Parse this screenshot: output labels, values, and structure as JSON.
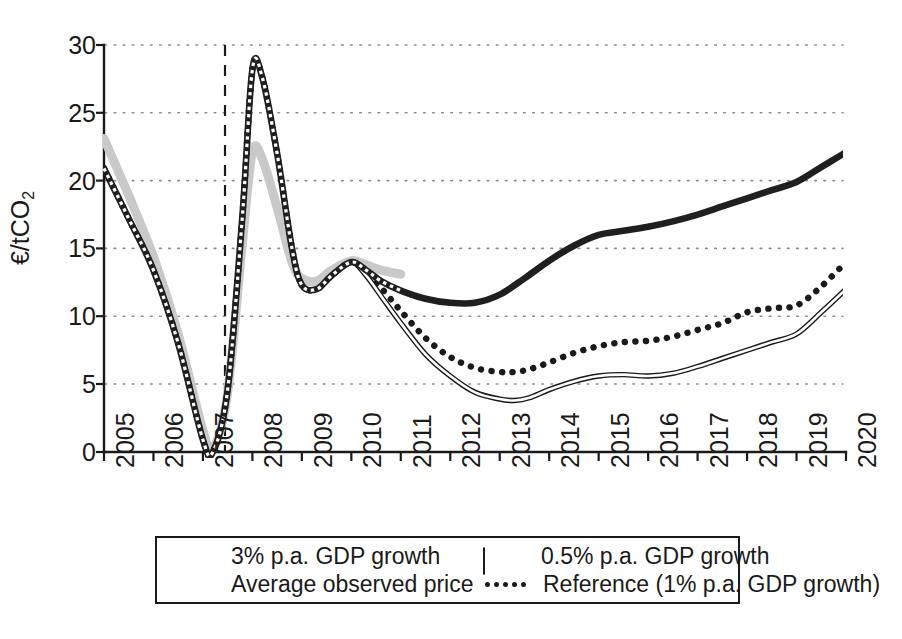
{
  "chart_data": {
    "type": "line",
    "title": "",
    "xlabel": "",
    "ylabel": "€/tCO2",
    "ylabel_base": "€/tCO",
    "ylabel_sub": "2",
    "xlim": [
      2005,
      2020
    ],
    "ylim": [
      0,
      30
    ],
    "yticks": [
      0,
      5,
      10,
      15,
      20,
      25,
      30
    ],
    "xticks": [
      "2005",
      "2006",
      "2007",
      "2008",
      "2009",
      "2010",
      "2011",
      "2012",
      "2013",
      "2014",
      "2015",
      "2016",
      "2017",
      "2018",
      "2019",
      "2020"
    ],
    "grid": "horizontal dotted gridlines at every y tick",
    "legend_position": "below axes, bordered box, two columns",
    "annotations": [
      {
        "name": "forecast-divider",
        "type": "vertical-dashed-line",
        "x": 2007.5,
        "label": ""
      }
    ],
    "series": [
      {
        "name": "3% p.a. GDP growth",
        "style": "thick solid dark",
        "color": "#1f1f1f",
        "x": [
          2005,
          2005.5,
          2006,
          2006.5,
          2007,
          2007.2,
          2007.5,
          2007.8,
          2008,
          2008.2,
          2008.5,
          2008.8,
          2009,
          2009.3,
          2009.6,
          2010,
          2010.3,
          2010.6,
          2011,
          2011.5,
          2012,
          2012.5,
          2013,
          2013.5,
          2014,
          2014.5,
          2015,
          2015.5,
          2016,
          2016.5,
          2017,
          2017.5,
          2018,
          2018.5,
          2019,
          2019.5,
          2020
        ],
        "y": [
          20.9,
          17.2,
          13.4,
          8.0,
          0.9,
          0.0,
          4.6,
          17.5,
          28.2,
          27.6,
          22.0,
          15.0,
          12.3,
          12.0,
          13.0,
          14.0,
          13.4,
          12.6,
          11.9,
          11.3,
          11.0,
          11.0,
          11.6,
          12.8,
          14.1,
          15.2,
          16.0,
          16.3,
          16.6,
          17.0,
          17.5,
          18.1,
          18.7,
          19.3,
          19.9,
          21.0,
          22.1
        ]
      },
      {
        "name": "0.5% p.a. GDP growth",
        "style": "thin double-stroke white fill",
        "color": "#ffffff",
        "edge": "#1a1a1a",
        "x": [
          2005,
          2005.5,
          2006,
          2006.5,
          2007,
          2007.2,
          2007.5,
          2007.8,
          2008,
          2008.2,
          2008.5,
          2008.8,
          2009,
          2009.3,
          2009.6,
          2010,
          2010.3,
          2010.6,
          2011,
          2011.5,
          2012,
          2012.5,
          2013,
          2013.3,
          2013.6,
          2014,
          2014.5,
          2015,
          2015.5,
          2016,
          2016.5,
          2017,
          2017.5,
          2018,
          2018.5,
          2019,
          2019.5,
          2020
        ],
        "y": [
          20.9,
          17.2,
          13.4,
          8.0,
          0.9,
          0.0,
          4.6,
          17.5,
          28.2,
          27.6,
          22.0,
          15.0,
          12.3,
          12.0,
          13.0,
          14.0,
          13.0,
          11.5,
          9.5,
          7.2,
          5.6,
          4.4,
          3.9,
          3.8,
          4.0,
          4.6,
          5.2,
          5.6,
          5.7,
          5.6,
          5.8,
          6.3,
          6.9,
          7.5,
          8.1,
          8.7,
          10.3,
          12.0
        ]
      },
      {
        "name": "Average observed price",
        "style": "thick light gray, historical only",
        "color": "#c9c9c9",
        "x": [
          2005,
          2005.5,
          2006,
          2006.5,
          2007,
          2007.2,
          2007.5,
          2007.8,
          2008,
          2008.2,
          2008.5,
          2008.8,
          2009,
          2009.3,
          2009.6,
          2010,
          2010.3,
          2010.6,
          2011
        ],
        "y": [
          23.1,
          18.9,
          14.4,
          8.7,
          1.6,
          0.2,
          4.4,
          15.5,
          22.1,
          21.6,
          18.0,
          14.0,
          12.8,
          12.6,
          13.4,
          14.1,
          13.8,
          13.4,
          13.1
        ]
      },
      {
        "name": "Reference (1% p.a. GDP growth)",
        "style": "dotted dark",
        "color": "#1a1a1a",
        "x": [
          2005,
          2005.5,
          2006,
          2006.5,
          2007,
          2007.2,
          2007.5,
          2007.8,
          2008,
          2008.2,
          2008.5,
          2008.8,
          2009,
          2009.3,
          2009.6,
          2010,
          2010.3,
          2010.6,
          2011,
          2011.5,
          2012,
          2012.5,
          2013,
          2013.3,
          2013.6,
          2014,
          2014.5,
          2015,
          2015.5,
          2016,
          2016.5,
          2017,
          2017.5,
          2018,
          2018.5,
          2019,
          2019.5,
          2020
        ],
        "y": [
          20.9,
          17.2,
          13.4,
          8.0,
          0.9,
          0.0,
          4.6,
          17.5,
          28.2,
          27.6,
          22.0,
          15.0,
          12.3,
          12.0,
          13.0,
          14.0,
          13.2,
          12.1,
          10.4,
          8.4,
          7.0,
          6.2,
          5.9,
          5.9,
          6.1,
          6.6,
          7.3,
          7.8,
          8.1,
          8.2,
          8.5,
          9.0,
          9.5,
          10.3,
          10.6,
          10.8,
          12.2,
          14.0
        ]
      }
    ]
  },
  "legend": {
    "items": [
      {
        "label": "3% p.a. GDP growth",
        "swatch": "thick-dark-line"
      },
      {
        "label": "0.5% p.a. GDP growth",
        "swatch": "thin-outline-line"
      },
      {
        "label": "Average observed price",
        "swatch": "thick-gray-line"
      },
      {
        "label": "Reference (1% p.a. GDP growth)",
        "swatch": "dotted-line"
      }
    ]
  },
  "colors": {
    "scenario_3pct": "#1f1f1f",
    "scenario_05pct": "#ffffff",
    "observed": "#c9c9c9",
    "reference": "#1a1a1a",
    "axis": "#1a1a1a",
    "grid": "#9a9a9a",
    "background": "#ffffff"
  }
}
